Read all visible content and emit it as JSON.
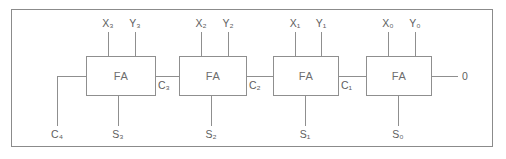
{
  "diagram": {
    "type": "logic-circuit",
    "colors": {
      "background": "#ffffff",
      "line": "#8f8f8f",
      "frame": "#8b8b8b",
      "text": "#5e5e5e"
    },
    "stages": [
      {
        "id": "stage-3",
        "block_label": "FA",
        "input_x": "X₃",
        "input_y": "Y₃",
        "sum_out": "S₃",
        "carry_out": "C₄",
        "carry_in": "C₃"
      },
      {
        "id": "stage-2",
        "block_label": "FA",
        "input_x": "X₂",
        "input_y": "Y₂",
        "sum_out": "S₂",
        "carry_out": "C₃",
        "carry_in": "C₂"
      },
      {
        "id": "stage-1",
        "block_label": "FA",
        "input_x": "X₁",
        "input_y": "Y₁",
        "sum_out": "S₁",
        "carry_out": "C₂",
        "carry_in": "C₁"
      },
      {
        "id": "stage-0",
        "block_label": "FA",
        "input_x": "X₀",
        "input_y": "Y₀",
        "sum_out": "S₀",
        "carry_out": "C₁",
        "carry_in": "0"
      }
    ],
    "labels": {
      "x3": "X₃",
      "y3": "Y₃",
      "x2": "X₂",
      "y2": "Y₂",
      "x1": "X₁",
      "y1": "Y₁",
      "x0": "X₀",
      "y0": "Y₀",
      "s3": "S₃",
      "s2": "S₂",
      "s1": "S₁",
      "s0": "S₀",
      "c4": "C₄",
      "c3": "C₃",
      "c2": "C₂",
      "c1": "C₁",
      "cin0": "0",
      "fa3": "FA",
      "fa2": "FA",
      "fa1": "FA",
      "fa0": "FA"
    }
  }
}
